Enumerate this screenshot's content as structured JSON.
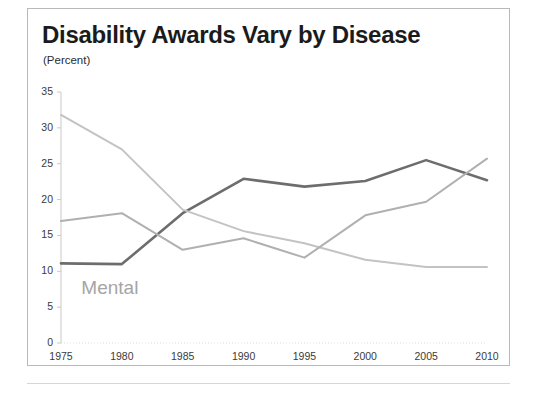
{
  "chart": {
    "title": "Disability Awards Vary by Disease",
    "subtitle": "(Percent)",
    "annotation_label": "Mental"
  },
  "chart_data": {
    "type": "line",
    "title": "Disability Awards Vary by Disease",
    "subtitle": "(Percent)",
    "xlabel": "",
    "ylabel": "Percent",
    "x": [
      1975,
      1980,
      1985,
      1990,
      1995,
      2000,
      2005,
      2010
    ],
    "xtick_labels": [
      "1975",
      "1980",
      "1985",
      "1990",
      "1995",
      "2000",
      "2005",
      "2010"
    ],
    "ytick_labels": [
      "0",
      "5",
      "10",
      "15",
      "20",
      "25",
      "30",
      "35"
    ],
    "yticks": [
      0,
      5,
      10,
      15,
      20,
      25,
      30,
      35
    ],
    "ylim": [
      0,
      35
    ],
    "xlim": [
      1975,
      2010
    ],
    "grid": false,
    "legend": "none",
    "annotations": [
      {
        "text": "Mental",
        "x": 1977,
        "y": 7.5,
        "color": "#a5a5a5"
      }
    ],
    "series": [
      {
        "name": "Mental",
        "color": "#6d6d6d",
        "width": 2.6,
        "values": [
          11.1,
          11.0,
          18.1,
          22.9,
          21.8,
          22.6,
          25.5,
          22.7
        ]
      },
      {
        "name": "Circulatory",
        "color": "#c3c3c3",
        "width": 2.0,
        "values": [
          31.8,
          27.0,
          18.6,
          15.6,
          13.9,
          11.6,
          10.6,
          10.6
        ]
      },
      {
        "name": "Musculoskeletal",
        "color": "#b0b0b0",
        "width": 2.0,
        "values": [
          17.0,
          18.1,
          13.0,
          14.6,
          11.9,
          17.8,
          19.7,
          25.7
        ]
      }
    ]
  },
  "axis_colors": {
    "tick_text": "#3a3a3a",
    "axis_line": "#c9c9c9",
    "frame": "#b9b9b9"
  }
}
